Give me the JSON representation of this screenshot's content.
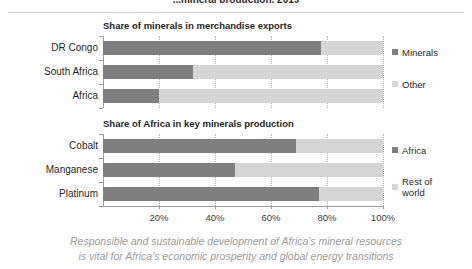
{
  "top_title": "...mineral production, 2019",
  "caption": {
    "line1": "Responsible and sustainable development of Africa's mineral resources",
    "line2": "is vital for Africa's economic prosperity and global energy transitions"
  },
  "axis": {
    "ticks": [
      "20%",
      "40%",
      "60%",
      "80%",
      "100%"
    ],
    "tick_values": [
      20,
      40,
      60,
      80,
      100
    ],
    "min": 0,
    "max": 100
  },
  "colors": {
    "series_primary": "#7f7f7f",
    "series_secondary": "#d5d5d5",
    "axis": "#9a9a9a",
    "gridline": "#b5b5b5",
    "caption": "#9b9b9b"
  },
  "chart_data": [
    {
      "type": "bar",
      "orientation": "horizontal",
      "stacked": true,
      "title": "Share of minerals in merchandise exports",
      "xlabel": "",
      "ylabel": "",
      "xlim": [
        0,
        100
      ],
      "grid": true,
      "legend_position": "right",
      "categories": [
        "DR Congo",
        "South Africa",
        "Africa"
      ],
      "series": [
        {
          "name": "Minerals",
          "values": [
            78,
            32,
            20
          ],
          "color": "#7f7f7f"
        },
        {
          "name": "Other",
          "values": [
            22,
            68,
            80
          ],
          "color": "#d5d5d5"
        }
      ]
    },
    {
      "type": "bar",
      "orientation": "horizontal",
      "stacked": true,
      "title": "Share of Africa in key minerals production",
      "xlabel": "",
      "ylabel": "",
      "xlim": [
        0,
        100
      ],
      "grid": true,
      "legend_position": "right",
      "categories": [
        "Cobalt",
        "Manganese",
        "Platinum"
      ],
      "series": [
        {
          "name": "Africa",
          "values": [
            69,
            47,
            77
          ],
          "color": "#7f7f7f"
        },
        {
          "name": "Rest of world",
          "values": [
            31,
            53,
            23
          ],
          "color": "#d5d5d5"
        }
      ]
    }
  ]
}
